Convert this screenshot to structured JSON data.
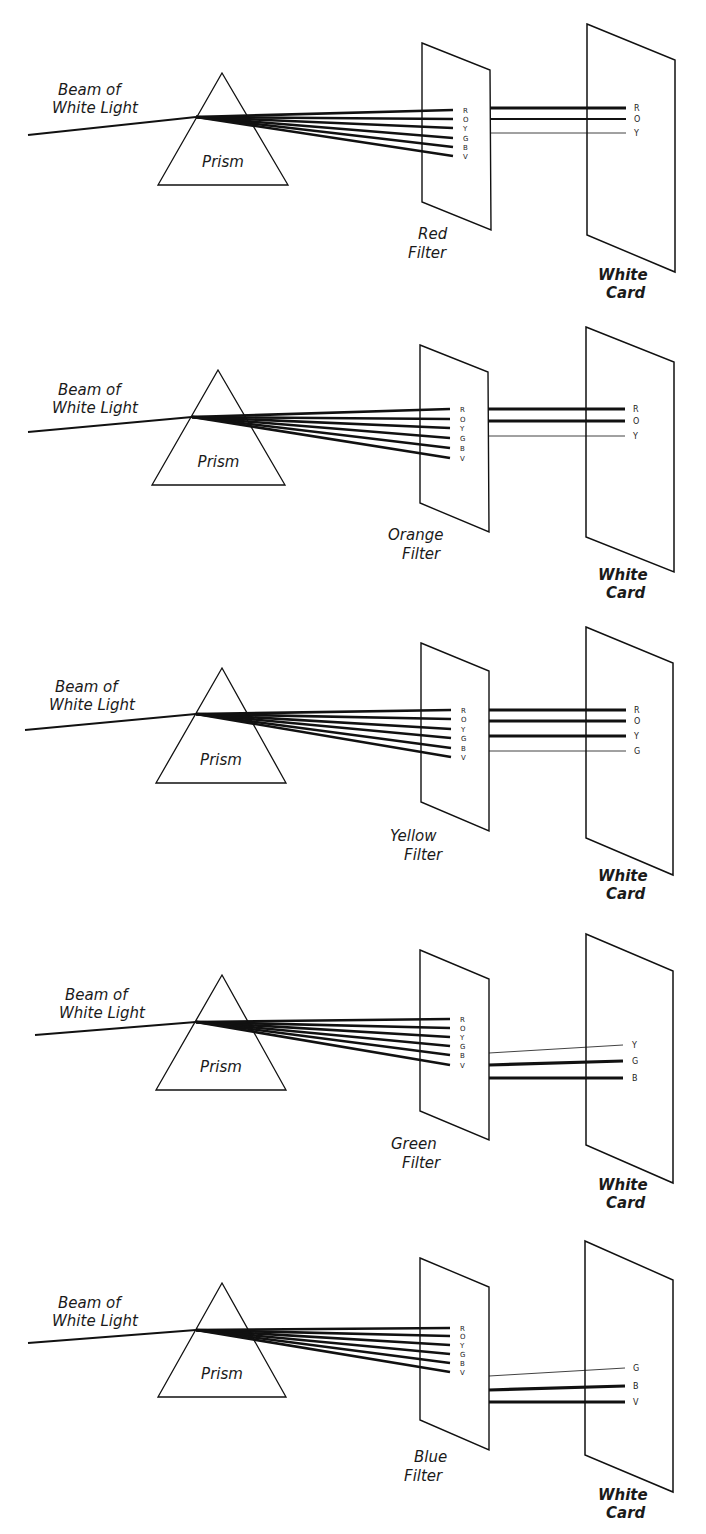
{
  "figure": {
    "beam_label_line1": "Beam of",
    "beam_label_line2": "White Light",
    "prism_label": "Prism",
    "card_label_line1": "White",
    "card_label_line2": "Card",
    "spectrum_letters": [
      "R",
      "O",
      "Y",
      "G",
      "B",
      "V"
    ]
  },
  "panels": [
    {
      "filter_name": "Red",
      "filter_label_line1": "Red",
      "filter_label_line2": "Filter",
      "transmitted": [
        {
          "letter": "R",
          "weight": "strong"
        },
        {
          "letter": "O",
          "weight": "medium"
        },
        {
          "letter": "Y",
          "weight": "weak"
        }
      ]
    },
    {
      "filter_name": "Orange",
      "filter_label_line1": "Orange",
      "filter_label_line2": "Filter",
      "transmitted": [
        {
          "letter": "R",
          "weight": "strong"
        },
        {
          "letter": "O",
          "weight": "strong"
        },
        {
          "letter": "Y",
          "weight": "weak"
        }
      ]
    },
    {
      "filter_name": "Yellow",
      "filter_label_line1": "Yellow",
      "filter_label_line2": "Filter",
      "transmitted": [
        {
          "letter": "R",
          "weight": "strong"
        },
        {
          "letter": "O",
          "weight": "strong"
        },
        {
          "letter": "Y",
          "weight": "strong"
        },
        {
          "letter": "G",
          "weight": "weak"
        }
      ]
    },
    {
      "filter_name": "Green",
      "filter_label_line1": "Green",
      "filter_label_line2": "Filter",
      "transmitted": [
        {
          "letter": "Y",
          "weight": "weak"
        },
        {
          "letter": "G",
          "weight": "strong"
        },
        {
          "letter": "B",
          "weight": "strong"
        }
      ]
    },
    {
      "filter_name": "Blue",
      "filter_label_line1": "Blue",
      "filter_label_line2": "Filter",
      "transmitted": [
        {
          "letter": "G",
          "weight": "weak"
        },
        {
          "letter": "B",
          "weight": "strong"
        },
        {
          "letter": "V",
          "weight": "strong"
        }
      ]
    }
  ],
  "colors": {
    "ink": "#111111",
    "background": "#ffffff"
  }
}
